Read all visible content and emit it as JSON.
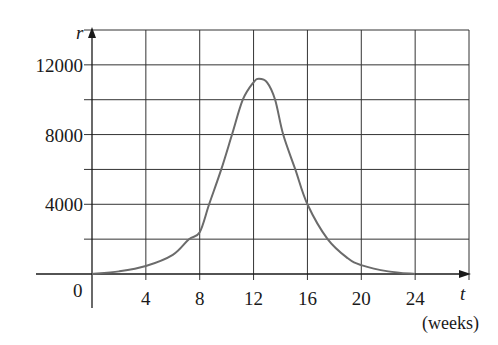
{
  "chart_data": {
    "type": "line",
    "title": "",
    "xlabel": "t",
    "xlabel_unit": "(weeks)",
    "ylabel": "r",
    "xlim": [
      0,
      28
    ],
    "ylim": [
      0,
      14000
    ],
    "x_ticks": [
      0,
      4,
      8,
      12,
      16,
      20,
      24
    ],
    "x_tick_labels": [
      "4",
      "8",
      "12",
      "16",
      "20",
      "24"
    ],
    "y_ticks": [
      4000,
      8000,
      12000
    ],
    "y_tick_labels": [
      "4000",
      "8000",
      "12000"
    ],
    "origin_label": "0",
    "grid": {
      "on": true,
      "x_step": 4,
      "y_step": 2000
    },
    "legend": null,
    "series": [
      {
        "name": "r(t)",
        "x": [
          0,
          2,
          4,
          6,
          7.2,
          8,
          8.7,
          9.6,
          10.4,
          11.2,
          12,
          12.4,
          13,
          13.6,
          14.2,
          15.1,
          16,
          17.5,
          19,
          20,
          22,
          24
        ],
        "values": [
          0,
          150,
          460,
          1100,
          2000,
          2400,
          4000,
          6000,
          8000,
          10000,
          11000,
          11200,
          11000,
          10000,
          8000,
          6000,
          4000,
          2000,
          900,
          510,
          150,
          0
        ]
      }
    ],
    "colors": {
      "curve": "#6b6b6b",
      "grid": "#333333",
      "axis": "#1a1a1a"
    }
  }
}
